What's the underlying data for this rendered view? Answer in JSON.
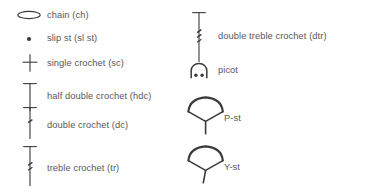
{
  "legend": {
    "title": "Crochet symbol legend",
    "text_color": "#58585a",
    "symbol_color": "#3a3a3c",
    "background": "#ffffff",
    "columns": [
      {
        "name": "left-column",
        "entries": [
          {
            "id": "chain",
            "symbol": "oval-chain-symbol",
            "label": "chain (ch)"
          },
          {
            "id": "slip-stitch",
            "symbol": "dot-slip-stitch-symbol",
            "label": "slip st (sl st)"
          },
          {
            "id": "single-crochet",
            "symbol": "cross-single-crochet-symbol",
            "label": "single crochet (sc)"
          },
          {
            "id": "half-double-crochet",
            "symbol": "tee-half-double-crochet-symbol",
            "label": "half double crochet (hdc)"
          },
          {
            "id": "double-crochet",
            "symbol": "tee-one-slash-double-crochet-symbol",
            "label": "double crochet (dc)"
          },
          {
            "id": "treble-crochet",
            "symbol": "tee-two-slash-treble-crochet-symbol",
            "label": "treble crochet (tr)"
          }
        ]
      },
      {
        "name": "right-column",
        "entries": [
          {
            "id": "double-treble-crochet",
            "symbol": "tee-three-slash-double-treble-symbol",
            "label": "double treble crochet (dtr)"
          },
          {
            "id": "picot",
            "symbol": "arch-picot-symbol",
            "label": "picot"
          },
          {
            "id": "p-stitch",
            "symbol": "puff-p-stitch-symbol",
            "label": "P-st"
          },
          {
            "id": "y-stitch",
            "symbol": "y-stitch-symbol",
            "label": "Y-st"
          }
        ]
      }
    ]
  }
}
